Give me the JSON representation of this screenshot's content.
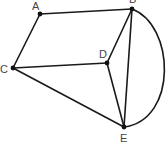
{
  "diagram": {
    "type": "graph",
    "nodes": [
      {
        "id": "A",
        "label": "A",
        "x": 40,
        "y": 14,
        "lx": 32,
        "ly": 10
      },
      {
        "id": "B",
        "label": "B",
        "x": 132,
        "y": 9,
        "lx": 129,
        "ly": 3
      },
      {
        "id": "C",
        "label": "C",
        "x": 13,
        "y": 68,
        "lx": 0,
        "ly": 73
      },
      {
        "id": "D",
        "label": "D",
        "x": 107,
        "y": 63,
        "lx": 99,
        "ly": 58
      },
      {
        "id": "E",
        "label": "E",
        "x": 124,
        "y": 127,
        "lx": 120,
        "ly": 142
      }
    ],
    "edges": [
      {
        "from": "A",
        "to": "B",
        "curved": false
      },
      {
        "from": "A",
        "to": "C",
        "curved": false
      },
      {
        "from": "C",
        "to": "D",
        "curved": false
      },
      {
        "from": "C",
        "to": "E",
        "curved": false
      },
      {
        "from": "D",
        "to": "B",
        "curved": false
      },
      {
        "from": "D",
        "to": "E",
        "curved": false
      },
      {
        "from": "B",
        "to": "E",
        "curved": false
      },
      {
        "from": "B",
        "to": "E",
        "curved": true,
        "path": "M132,9 C175,25 178,120 124,127"
      }
    ]
  }
}
